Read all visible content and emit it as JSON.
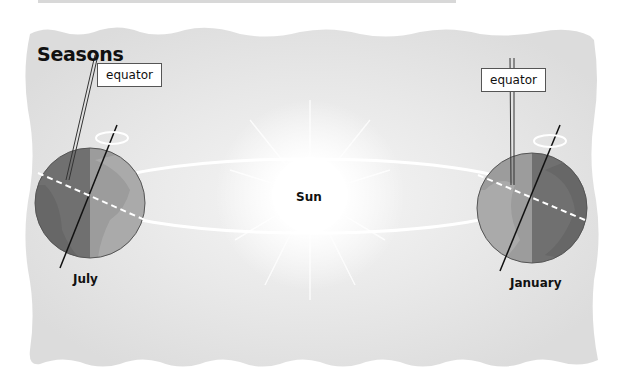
{
  "diagram": {
    "title": "Seasons",
    "center_label": "Sun",
    "earths": [
      {
        "position": "left",
        "month": "July",
        "callout": "equator"
      },
      {
        "position": "right",
        "month": "January",
        "callout": "equator"
      }
    ]
  },
  "colors": {
    "background_panel": "#e6e6e6",
    "earth_dark": "#7a7a7a",
    "earth_light": "#9a9a9a",
    "orbit": "#ffffff",
    "sun_glow": "#ffffff"
  }
}
